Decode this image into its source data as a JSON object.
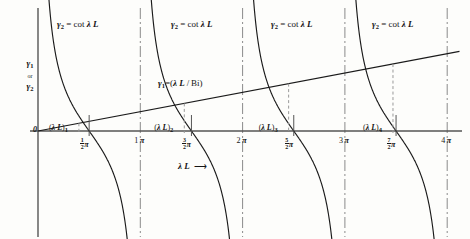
{
  "chart_data": {
    "type": "line",
    "title": "",
    "xlabel": "λ L",
    "ylabel_parts": [
      "γ",
      "1",
      "or",
      "γ",
      "2"
    ],
    "xlim": [
      -0.12,
      4.25
    ],
    "ylim": [
      -2.6,
      2.6
    ],
    "grid": false,
    "legend": "inline-annotations",
    "origin_label": "0",
    "axis_arrow_label": "λ L",
    "series": [
      {
        "name": "γ₂ = cot λL",
        "label": "γ₂ = cot λ L",
        "type": "cotangent-branches",
        "branch_count": 4,
        "asymptotes_pi": [
          0,
          1,
          2,
          3,
          4
        ]
      },
      {
        "name": "γ₁ = (λL / Bi)",
        "label": "γ₁=(λ L / Bi)",
        "type": "straight-line",
        "through_origin": true,
        "slope_per_pi": 0.42
      }
    ],
    "intersections": [
      {
        "label": "(λ L)",
        "index": "1",
        "x_pi": 0.4,
        "y": 0.168
      },
      {
        "label": "(λ L)",
        "index": "2",
        "x_pi": 1.43,
        "y": 0.6
      },
      {
        "label": "(λ L)",
        "index": "3",
        "x_pi": 2.45,
        "y": 1.03
      },
      {
        "label": "(λ L)",
        "index": "4",
        "x_pi": 3.47,
        "y": 1.455
      }
    ],
    "xticks": [
      {
        "x_pi": 0.5,
        "whole": "",
        "num": "1",
        "den": "2",
        "pi": "π"
      },
      {
        "x_pi": 1.0,
        "whole": "1",
        "num": "",
        "den": "",
        "pi": "π"
      },
      {
        "x_pi": 1.5,
        "whole": "",
        "num": "3",
        "den": "2",
        "pi": "π"
      },
      {
        "x_pi": 2.0,
        "whole": "2",
        "num": "",
        "den": "",
        "pi": "π"
      },
      {
        "x_pi": 2.5,
        "whole": "",
        "num": "5",
        "den": "2",
        "pi": "π"
      },
      {
        "x_pi": 3.0,
        "whole": "3",
        "num": "",
        "den": "",
        "pi": "π"
      },
      {
        "x_pi": 3.5,
        "whole": "",
        "num": "7",
        "den": "2",
        "pi": "π"
      },
      {
        "x_pi": 4.0,
        "whole": "4",
        "num": "",
        "den": "",
        "pi": "π"
      }
    ],
    "colors": {
      "curve": "#1a1a1a",
      "axis": "#555555",
      "asymptote": "#8a8a8a",
      "dashed_drop": "#9a9a9a",
      "background": "#fdfdfb",
      "text": "#161616"
    }
  },
  "annotations": {
    "cot_label_1": "γ₂ = cot λ L",
    "cot_label_2": "γ₂ = cot λ L",
    "cot_label_3": "γ₂ = cot λ L",
    "cot_label_4": "γ₂ = cot λ L",
    "line_label": "γ₁=(λ L / Bi)"
  }
}
